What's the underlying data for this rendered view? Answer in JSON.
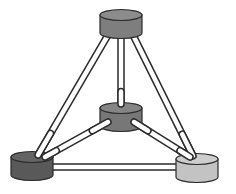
{
  "diagram": {
    "type": "tetrahedral-network",
    "width": 236,
    "height": 194,
    "background": "#ffffff",
    "stroke": "#2a2a2a",
    "tube_fill": "#ffffff",
    "nodes": [
      {
        "id": "top",
        "cx": 121,
        "top_cy": 15,
        "rx": 21,
        "ry": 5.5,
        "h": 18,
        "body": "#7e7e7e",
        "cap": "#8c8c8c"
      },
      {
        "id": "center",
        "cx": 121,
        "top_cy": 108,
        "rx": 21,
        "ry": 5.5,
        "h": 18,
        "body": "#777777",
        "cap": "#858585"
      },
      {
        "id": "bottom-left",
        "cx": 32,
        "top_cy": 157,
        "rx": 21,
        "ry": 5.5,
        "h": 18,
        "body": "#595959",
        "cap": "#646464"
      },
      {
        "id": "bottom-right",
        "cx": 197,
        "top_cy": 159,
        "rx": 21,
        "ry": 5.5,
        "h": 18,
        "body": "#c3c3c3",
        "cap": "#cdcdcd"
      }
    ],
    "edges": [
      {
        "from": "top",
        "to": "bottom-left",
        "x1": 108,
        "y1": 35,
        "x2": 38,
        "y2": 155
      },
      {
        "from": "top",
        "to": "center",
        "x1": 121,
        "y1": 35,
        "x2": 121,
        "y2": 104
      },
      {
        "from": "top",
        "to": "bottom-right",
        "x1": 133,
        "y1": 35,
        "x2": 193,
        "y2": 156
      },
      {
        "from": "center",
        "to": "bottom-left",
        "x1": 108,
        "y1": 122,
        "x2": 45,
        "y2": 157
      },
      {
        "from": "center",
        "to": "bottom-right",
        "x1": 134,
        "y1": 122,
        "x2": 190,
        "y2": 157
      },
      {
        "from": "bottom-left",
        "to": "bottom-right",
        "x1": 53,
        "y1": 167,
        "x2": 176,
        "y2": 167
      }
    ]
  }
}
